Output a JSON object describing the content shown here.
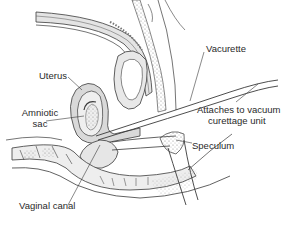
{
  "diagram": {
    "type": "anatomical cross-section",
    "labels": {
      "vacurette": "Vacurette",
      "uterus": "Uterus",
      "amniotic_line1": "Amniotic",
      "amniotic_line2": "sac",
      "attaches_line1": "Attaches to vacuum",
      "attaches_line2": "curettage unit",
      "speculum": "Speculum",
      "vaginal_canal": "Vaginal canal"
    },
    "colors": {
      "line": "#3a3a3a",
      "shade": "#d9d9d9",
      "light_shade": "#ececec",
      "background": "#ffffff"
    }
  }
}
